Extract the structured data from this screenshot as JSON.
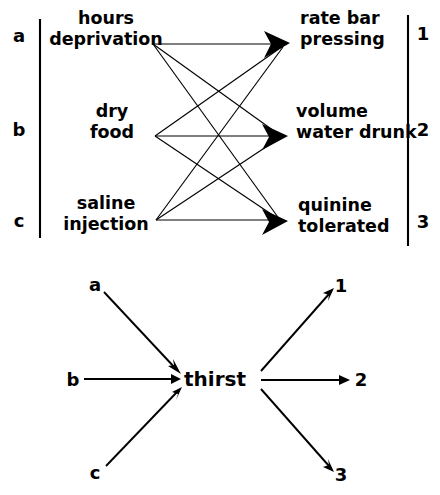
{
  "figure": {
    "background_color": "#ffffff",
    "ink_color": "#000000",
    "panels": [
      {
        "id": "upper-panel",
        "name": "many-to-many-mapping",
        "description": "Three independent variables each connected by arrows to three dependent variables",
        "left_markers": [
          "a",
          "b",
          "c"
        ],
        "right_markers": [
          "1",
          "2",
          "3"
        ],
        "left_nodes": [
          {
            "key": "a",
            "lines": [
              "hours",
              "deprivation"
            ]
          },
          {
            "key": "b",
            "lines": [
              "dry",
              "food"
            ]
          },
          {
            "key": "c",
            "lines": [
              "saline",
              "injection"
            ]
          }
        ],
        "right_nodes": [
          {
            "key": "1",
            "lines": [
              "rate bar",
              "pressing"
            ]
          },
          {
            "key": "2",
            "lines": [
              "volume",
              "water drunk"
            ]
          },
          {
            "key": "3",
            "lines": [
              "quinine",
              "tolerated"
            ]
          }
        ],
        "edges": [
          {
            "from": "a",
            "to": "1"
          },
          {
            "from": "a",
            "to": "2"
          },
          {
            "from": "a",
            "to": "3"
          },
          {
            "from": "b",
            "to": "1"
          },
          {
            "from": "b",
            "to": "2"
          },
          {
            "from": "b",
            "to": "3"
          },
          {
            "from": "c",
            "to": "1"
          },
          {
            "from": "c",
            "to": "2"
          },
          {
            "from": "c",
            "to": "3"
          }
        ]
      },
      {
        "id": "lower-panel",
        "name": "intervening-variable",
        "description": "Three inputs converge on a single intervening variable which fans out to three outputs",
        "center_label": "thirst",
        "input_markers": [
          "a",
          "b",
          "c"
        ],
        "output_markers": [
          "1",
          "2",
          "3"
        ],
        "edges": [
          {
            "from": "a",
            "to": "thirst"
          },
          {
            "from": "b",
            "to": "thirst"
          },
          {
            "from": "c",
            "to": "thirst"
          },
          {
            "from": "thirst",
            "to": "1"
          },
          {
            "from": "thirst",
            "to": "2"
          },
          {
            "from": "thirst",
            "to": "3"
          }
        ]
      }
    ]
  }
}
